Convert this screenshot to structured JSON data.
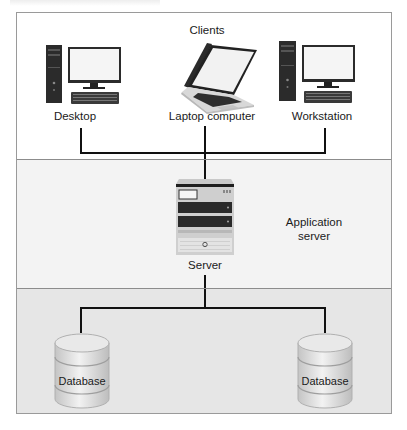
{
  "diagram": {
    "type": "three-tier architecture",
    "tiers": [
      {
        "name": "clients",
        "title": "Clients",
        "nodes": [
          {
            "id": "desktop",
            "label": "Desktop",
            "icon": "desktop-computer-icon"
          },
          {
            "id": "laptop",
            "label": "Laptop computer",
            "icon": "laptop-icon"
          },
          {
            "id": "workstation",
            "label": "Workstation",
            "icon": "workstation-computer-icon"
          }
        ]
      },
      {
        "name": "application",
        "title": "Application server",
        "title_lines": [
          "Application",
          "server"
        ],
        "nodes": [
          {
            "id": "server",
            "label": "Server",
            "icon": "server-rack-icon"
          }
        ]
      },
      {
        "name": "data",
        "title": "",
        "nodes": [
          {
            "id": "db1",
            "label": "Database",
            "icon": "database-cylinder-icon"
          },
          {
            "id": "db2",
            "label": "Database",
            "icon": "database-cylinder-icon"
          }
        ]
      }
    ],
    "connections": [
      {
        "from": "desktop",
        "to": "server"
      },
      {
        "from": "laptop",
        "to": "server"
      },
      {
        "from": "workstation",
        "to": "server"
      },
      {
        "from": "server",
        "to": "db1"
      },
      {
        "from": "server",
        "to": "db2"
      }
    ],
    "colors": {
      "tier_clients_bg": "#ffffff",
      "tier_app_bg": "#f3f3f3",
      "tier_data_bg": "#e6e6e6",
      "line": "#111111",
      "border": "#9a9a9a"
    }
  }
}
